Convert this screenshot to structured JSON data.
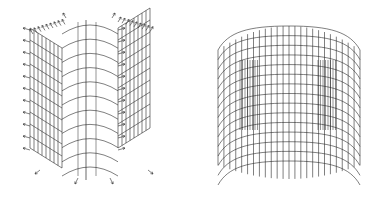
{
  "figure": {
    "background": "#ffffff",
    "stroke_color": "#2a2a2a",
    "panels": [
      {
        "id": "left",
        "description": "3D wireframe mesh of hollow shell-like structure with arrow load vectors",
        "has_arrows": true,
        "rows": 10,
        "cols_side": 8
      },
      {
        "id": "right",
        "description": "3D deformed wireframe mesh of rounded box-like shell",
        "has_arrows": false,
        "rows": 14,
        "cols": 24
      }
    ]
  }
}
